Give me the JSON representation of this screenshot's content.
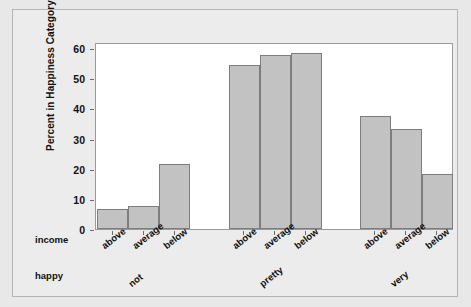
{
  "chart_data": {
    "type": "bar",
    "title": "",
    "subtitle": "",
    "xlabel": "",
    "ylabel": "Percent in Happiness Category",
    "ylim": [
      0,
      62
    ],
    "y_ticks": [
      0,
      10,
      20,
      30,
      40,
      50,
      60
    ],
    "grid": false,
    "legend": "none",
    "axis_names": {
      "inner": "income",
      "outer": "happy"
    },
    "groups": [
      {
        "name": "not",
        "categories": [
          "above",
          "average",
          "below"
        ],
        "values": [
          6.8,
          7.5,
          21.6
        ]
      },
      {
        "name": "pretty",
        "categories": [
          "above",
          "average",
          "below"
        ],
        "values": [
          54.4,
          57.6,
          58.5
        ]
      },
      {
        "name": "very",
        "categories": [
          "above",
          "average",
          "below"
        ],
        "values": [
          37.4,
          33.2,
          18.2
        ]
      }
    ],
    "categories": [
      "above",
      "average",
      "below"
    ],
    "series": [
      {
        "name": "not",
        "values": [
          6.8,
          7.5,
          21.6
        ]
      },
      {
        "name": "pretty",
        "values": [
          54.4,
          57.6,
          58.5
        ]
      },
      {
        "name": "very",
        "values": [
          37.4,
          33.2,
          18.2
        ]
      }
    ],
    "colors": {
      "bar_fill": "#c2c2c2",
      "bar_stroke": "#7d7d7d",
      "plot_background": "#ffffff",
      "figure_background": "#ececec",
      "axis": "#6b6b6b",
      "text": "#111111"
    }
  }
}
